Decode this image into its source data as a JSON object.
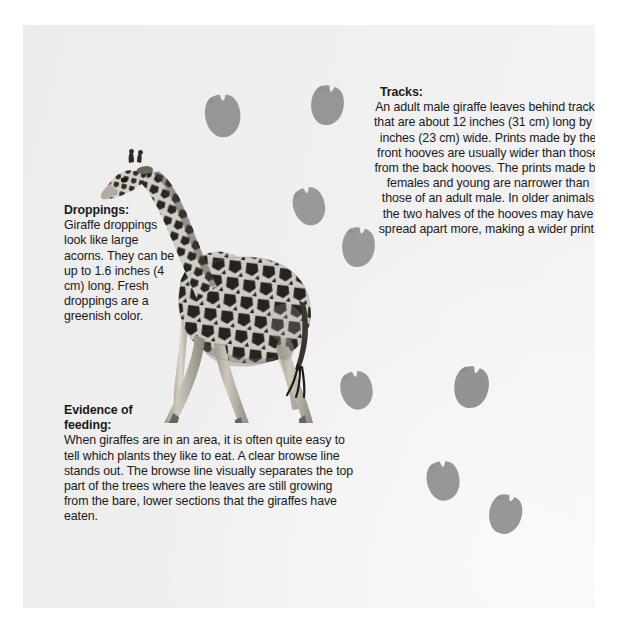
{
  "page": {
    "width": 617,
    "height": 631,
    "background_color": "#ffffff",
    "panel_color": "#eeeeef",
    "text_color": "#1a1a1a",
    "print_color": "#8d8d8d"
  },
  "blocks": {
    "droppings": {
      "heading": "Droppings:",
      "body": "Giraffe droppings look like large acorns. They can be up to 1.6 inches (4 cm) long. Fresh droppings are a greenish color."
    },
    "tracks": {
      "heading": "Tracks:",
      "body": "An adult male giraffe leaves behind tracks that are about 12 inches (31 cm) long by 9 inches (23 cm) wide. Prints made by the front hooves are usually wider than those from the back hooves. The prints made by females and young are narrower than those of an adult male. In older animals the two halves of the hooves may have spread apart more, making a wider print."
    },
    "feeding": {
      "heading": "Evidence of feeding:",
      "body": "When giraffes are in an area, it is often quite easy to tell which plants they like to eat. A clear browse line stands out. The browse line visually separates the top part of the trees where the leaves are still growing from the bare, lower sections that the giraffes have eaten."
    }
  },
  "illustrations": {
    "animal": {
      "name": "giraffe-photo",
      "description": "Grayscale photograph of a walking giraffe, head turned to the left",
      "x": 70,
      "y": 108,
      "width": 236,
      "height": 290
    },
    "hoof_prints": [
      {
        "id": "print-1",
        "x": 203,
        "y": 93,
        "w": 40,
        "h": 45,
        "rot": -8,
        "opacity": 0.88
      },
      {
        "id": "print-2",
        "x": 309,
        "y": 84,
        "w": 36,
        "h": 42,
        "rot": 6,
        "opacity": 0.88
      },
      {
        "id": "print-3",
        "x": 290,
        "y": 186,
        "w": 39,
        "h": 40,
        "rot": -18,
        "opacity": 0.86
      },
      {
        "id": "print-4",
        "x": 340,
        "y": 226,
        "w": 36,
        "h": 42,
        "rot": 4,
        "opacity": 0.86
      },
      {
        "id": "print-5",
        "x": 339,
        "y": 369,
        "w": 35,
        "h": 42,
        "rot": -14,
        "opacity": 0.86
      },
      {
        "id": "print-6",
        "x": 452,
        "y": 365,
        "w": 38,
        "h": 44,
        "rot": 8,
        "opacity": 0.9
      },
      {
        "id": "print-7",
        "x": 425,
        "y": 458,
        "w": 36,
        "h": 45,
        "rot": -10,
        "opacity": 0.88
      },
      {
        "id": "print-8",
        "x": 487,
        "y": 492,
        "w": 36,
        "h": 44,
        "rot": 12,
        "opacity": 0.88
      }
    ]
  }
}
